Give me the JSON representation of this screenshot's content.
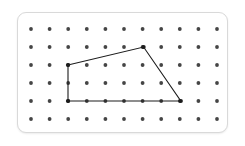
{
  "figure": {
    "panel": {
      "background_color": "#ffffff",
      "border_color": "#d9d9d9",
      "x": 17,
      "y": 12,
      "width": 211,
      "height": 121,
      "corner_radius": 9
    },
    "grid": {
      "columns": 11,
      "rows": 6,
      "spacing_x": 18.6,
      "spacing_y": 18,
      "origin_x": 31,
      "origin_y": 29,
      "peg_radius": 1.9,
      "peg_color": "#454545",
      "column_labels": [
        1,
        2,
        3,
        4,
        5,
        6,
        7,
        8,
        9,
        10,
        11
      ],
      "row_labels": [
        1,
        2,
        3,
        4,
        5,
        6
      ]
    },
    "shape": {
      "name": "quadrilateral",
      "stroke_color": "#1c1c1c",
      "stroke_width": 1.1,
      "fill": "none",
      "vertices": [
        {
          "label": "left-vertex",
          "col": 3,
          "row": 3,
          "x": 68,
          "y": 65
        },
        {
          "label": "apex-vertex",
          "col": 7,
          "row": 2,
          "x": 143.6,
          "y": 47
        },
        {
          "label": "right-vertex",
          "col": 9,
          "row": 5,
          "x": 180.8,
          "y": 101
        },
        {
          "label": "bottom-left-vertex",
          "col": 3,
          "row": 5,
          "x": 68,
          "y": 101
        }
      ],
      "edges": [
        {
          "from": "left-vertex",
          "to": "apex-vertex"
        },
        {
          "from": "apex-vertex",
          "to": "right-vertex"
        },
        {
          "from": "right-vertex",
          "to": "bottom-left-vertex"
        },
        {
          "from": "bottom-left-vertex",
          "to": "left-vertex"
        }
      ]
    }
  }
}
